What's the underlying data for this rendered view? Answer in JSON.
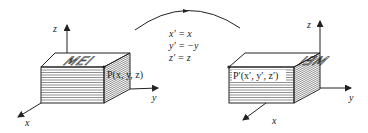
{
  "diagram": {
    "left_box": {
      "top_text": "MEI",
      "point_label": "P(x, y, z)",
      "axes": {
        "x": "x",
        "y": "y",
        "z": "z"
      }
    },
    "right_box": {
      "top_text": "MEI",
      "top_text_mirrored": true,
      "point_label": "P′(x′, y′, z′)",
      "axes": {
        "x": "x",
        "y": "y",
        "z": "z"
      }
    },
    "transformation": {
      "arrow_direction": "left-to-right",
      "equations": [
        "x′ = x",
        "y′ = −y",
        "z′ = z"
      ]
    },
    "colors": {
      "ink": "#222222",
      "background": "#ffffff"
    }
  }
}
